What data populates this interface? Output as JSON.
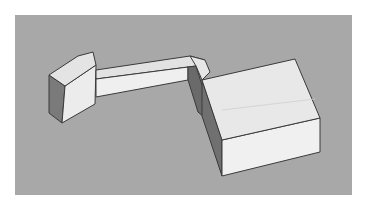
{
  "scene": {
    "description": "3D massing model: small angled block connected by an elevated corridor to a large box",
    "colors": {
      "background": "#ffffff",
      "ground": "#a8a8a8",
      "face_light": "#eeeeee",
      "face_mid": "#dcdcdc",
      "face_dark": "#6e6e6e",
      "edge": "#3a3a3a"
    }
  }
}
